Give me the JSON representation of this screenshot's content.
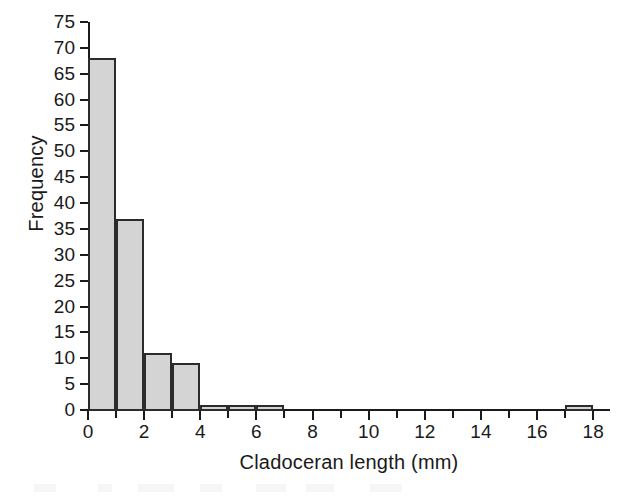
{
  "chart_data": {
    "type": "bar",
    "title": "",
    "subtitle": "",
    "xlabel": "Cladoceran length (mm)",
    "ylabel": "Frequency",
    "xlim": [
      0,
      18.6
    ],
    "ylim": [
      0,
      75
    ],
    "grid": false,
    "legend": null,
    "bin_width": 1,
    "categories": [
      "0-1",
      "1-2",
      "2-3",
      "3-4",
      "4-5",
      "5-6",
      "6-7",
      "7-8",
      "8-9",
      "9-10",
      "10-11",
      "11-12",
      "12-13",
      "13-14",
      "14-15",
      "15-16",
      "16-17",
      "17-18"
    ],
    "bin_starts": [
      0,
      1,
      2,
      3,
      4,
      5,
      6,
      7,
      8,
      9,
      10,
      11,
      12,
      13,
      14,
      15,
      16,
      17
    ],
    "values": [
      68,
      37,
      11,
      9,
      1,
      1,
      1,
      0,
      0,
      0,
      0,
      0,
      0,
      0,
      0,
      0,
      0,
      1
    ],
    "x_ticks_major": [
      0,
      2,
      4,
      6,
      8,
      10,
      12,
      14,
      16,
      18
    ],
    "x_tick_labels": [
      "0",
      "2",
      "4",
      "6",
      "8",
      "10",
      "12",
      "14",
      "16",
      "18"
    ],
    "x_ticks_minor": [
      1,
      3,
      5,
      7,
      9,
      11,
      13,
      15,
      17
    ],
    "y_ticks": [
      0,
      5,
      10,
      15,
      20,
      25,
      30,
      35,
      40,
      45,
      50,
      55,
      60,
      65,
      70,
      75
    ],
    "y_tick_labels": [
      "0",
      "5",
      "10",
      "15",
      "20",
      "25",
      "30",
      "35",
      "40",
      "45",
      "50",
      "55",
      "60",
      "65",
      "70",
      "75"
    ],
    "bar_fill_color": "#d4d4d4",
    "bar_edge_color": "#2b2b2b",
    "axis_color": "#1a1a1a",
    "background_color": "#ffffff"
  }
}
